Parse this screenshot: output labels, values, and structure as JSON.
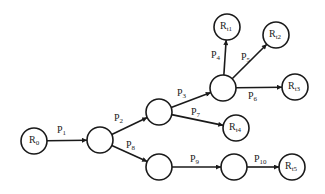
{
  "diagram": {
    "type": "tree-graph",
    "colors": {
      "stroke": "#1a1a1a",
      "fill": "#ffffff",
      "background": "#ffffff"
    },
    "node_radius": 13,
    "nodes": [
      {
        "id": "R0",
        "label": "R",
        "sub": "0",
        "x": 34,
        "y": 141
      },
      {
        "id": "A",
        "label": "",
        "sub": "",
        "x": 100,
        "y": 140
      },
      {
        "id": "B",
        "label": "",
        "sub": "",
        "x": 159,
        "y": 112
      },
      {
        "id": "C",
        "label": "",
        "sub": "",
        "x": 159,
        "y": 167
      },
      {
        "id": "E",
        "label": "",
        "sub": "",
        "x": 223,
        "y": 88
      },
      {
        "id": "D",
        "label": "",
        "sub": "",
        "x": 234,
        "y": 167
      },
      {
        "id": "Rt1",
        "label": "R",
        "sub": "t1",
        "x": 227,
        "y": 27
      },
      {
        "id": "Rt2",
        "label": "R",
        "sub": "t2",
        "x": 276,
        "y": 35
      },
      {
        "id": "Rt3",
        "label": "R",
        "sub": "t3",
        "x": 295,
        "y": 87
      },
      {
        "id": "Rt4",
        "label": "R",
        "sub": "t4",
        "x": 236,
        "y": 128
      },
      {
        "id": "Rt5",
        "label": "R",
        "sub": "t5",
        "x": 292,
        "y": 167
      }
    ],
    "edges": [
      {
        "from": "R0",
        "to": "A",
        "label": "P",
        "sub": "1",
        "lx": 57,
        "ly": 133
      },
      {
        "from": "A",
        "to": "B",
        "label": "P",
        "sub": "2",
        "lx": 114,
        "ly": 121
      },
      {
        "from": "B",
        "to": "E",
        "label": "P",
        "sub": "3",
        "lx": 177,
        "ly": 96
      },
      {
        "from": "E",
        "to": "Rt1",
        "label": "P",
        "sub": "4",
        "lx": 211,
        "ly": 58
      },
      {
        "from": "E",
        "to": "Rt2",
        "label": "P",
        "sub": "5",
        "lx": 241,
        "ly": 60
      },
      {
        "from": "E",
        "to": "Rt3",
        "label": "P",
        "sub": "6",
        "lx": 248,
        "ly": 99
      },
      {
        "from": "B",
        "to": "Rt4",
        "label": "P",
        "sub": "7",
        "lx": 191,
        "ly": 115
      },
      {
        "from": "A",
        "to": "C",
        "label": "P",
        "sub": "8",
        "lx": 126,
        "ly": 148
      },
      {
        "from": "C",
        "to": "D",
        "label": "P",
        "sub": "9",
        "lx": 190,
        "ly": 162
      },
      {
        "from": "D",
        "to": "Rt5",
        "label": "P",
        "sub": "10",
        "lx": 254,
        "ly": 162
      }
    ]
  }
}
